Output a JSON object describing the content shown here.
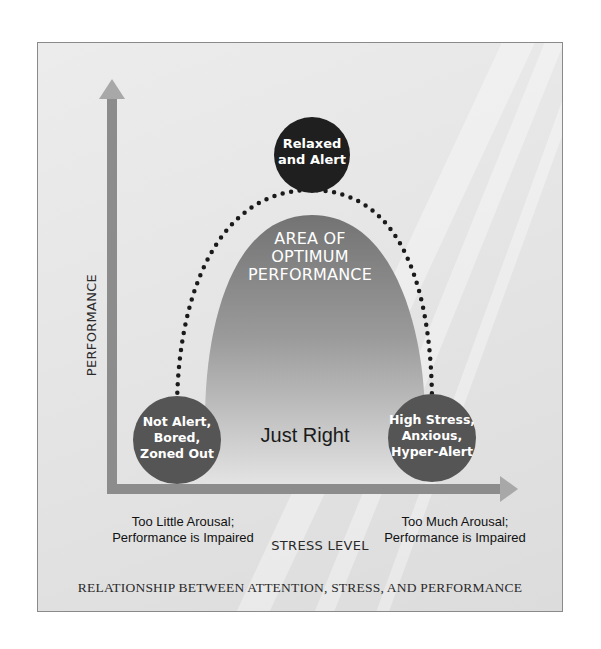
{
  "diagram": {
    "title": "RELATIONSHIP BETWEEN ATTENTION, STRESS, AND PERFORMANCE",
    "y_axis_label": "PERFORMANCE",
    "x_axis_label": "STRESS LEVEL",
    "peak_circle": {
      "line1": "Relaxed",
      "line2": "and Alert"
    },
    "left_circle": {
      "line1": "Not Alert,",
      "line2": "Bored,",
      "line3": "Zoned Out"
    },
    "right_circle": {
      "line1": "High Stress,",
      "line2": "Anxious,",
      "line3": "Hyper-Alert"
    },
    "area_label": {
      "line1": "AREA OF",
      "line2": "OPTIMUM",
      "line3": "PERFORMANCE"
    },
    "center_label": "Just Right",
    "left_note": {
      "line1": "Too Little Arousal;",
      "line2": "Performance is Impaired"
    },
    "right_note": {
      "line1": "Too Much Arousal;",
      "line2": "Performance is Impaired"
    },
    "colors": {
      "circle_dark": "#1f1f1f",
      "circle_mid": "#5a5a5a",
      "bell_top": "#7a7a7a",
      "bell_bottom": "#e2e2e2",
      "axis": "#8c8c8c",
      "dots": "#1a1a1a"
    }
  }
}
